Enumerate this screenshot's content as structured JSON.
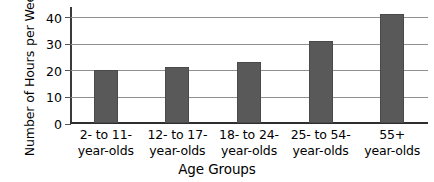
{
  "chart_data": {
    "type": "bar",
    "title": "",
    "xlabel": "Age Groups",
    "ylabel": "Number of Hours per Week",
    "ylabel_line1": "Number of Hours",
    "ylabel_line2": "per Week",
    "categories": [
      "2- to 11- year-olds",
      "12- to 17- year-olds",
      "18- to 24- year-olds",
      "25- to 54- year-olds",
      "55+ year-olds"
    ],
    "category_lines": [
      {
        "line1": "2- to 11-",
        "line2": "year-olds"
      },
      {
        "line1": "12- to 17-",
        "line2": "year-olds"
      },
      {
        "line1": "18- to 24-",
        "line2": "year-olds"
      },
      {
        "line1": "25- to 54-",
        "line2": "year-olds"
      },
      {
        "line1": "55+",
        "line2": "year-olds"
      }
    ],
    "values": [
      20,
      21,
      23,
      31,
      41
    ],
    "ylim": [
      0,
      44
    ],
    "yticks": [
      0,
      10,
      20,
      30,
      40
    ],
    "ytick_labels": [
      "0",
      "10",
      "20",
      "30",
      "40"
    ],
    "grid": true,
    "grid_axis": "y",
    "legend": "none",
    "bar_color": "#595959",
    "gridline_color": "#8f8f8f",
    "axis_color": "#2e2e2e",
    "background_color": "#ffffff"
  }
}
